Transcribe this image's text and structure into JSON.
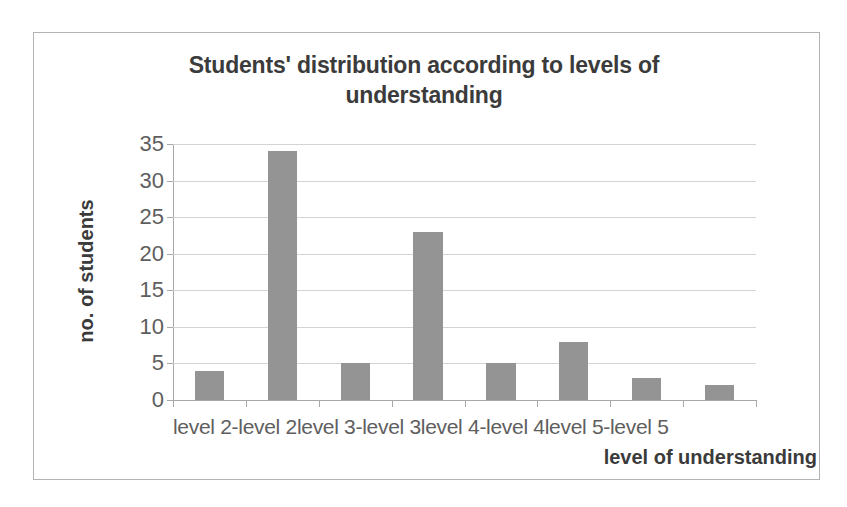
{
  "chart_data": {
    "type": "bar",
    "title": "Students' distribution according to levels of understanding",
    "title_line1": "Students' distribution according to levels of",
    "title_line2": "understanding",
    "xlabel": "level of understanding",
    "ylabel": "no. of students",
    "categories": [
      "level 2",
      "-level 2",
      "level 3",
      "-level 3",
      "level 4",
      "-level 4",
      "level 5",
      "-level 5"
    ],
    "values": [
      4,
      34,
      5,
      23,
      5,
      8,
      3,
      2
    ],
    "ylim": [
      0,
      35
    ],
    "y_ticks": [
      0,
      5,
      10,
      15,
      20,
      25,
      30,
      35
    ],
    "y_tick_labels": [
      "0",
      "5",
      "10",
      "15",
      "20",
      "25",
      "30",
      "35"
    ],
    "grid": true,
    "legend": false,
    "bar_color": "#949494",
    "gridline_color": "#d3d3d3",
    "axis_color": "#a8a8a8",
    "text_color": "#5e5e5e",
    "title_color": "#3b3b3b",
    "category_label_row": "level 2-level 2level 3-level 3level 4-level 4level 5-level 5"
  }
}
